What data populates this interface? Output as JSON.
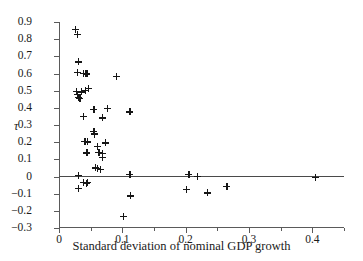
{
  "chart_data": {
    "type": "scatter",
    "title": "",
    "xlabel": "Standard deviation of nominal GDP growth",
    "ylabel": "τ",
    "xlim": [
      0,
      0.45
    ],
    "ylim": [
      -0.3,
      0.9
    ],
    "grid": false,
    "legend": null,
    "marker": "plus",
    "marker_color": "#161616",
    "axis_color": "#5a5a5a",
    "reference_lines": [
      {
        "name": "zero-line",
        "axis": "y",
        "value": 0
      }
    ],
    "xticks": [
      0,
      0.1,
      0.2,
      0.3,
      0.4
    ],
    "xtick_labels": [
      "0",
      "0.1",
      "0.2",
      "0.3",
      "0.4"
    ],
    "xticks_minor": [
      0.05,
      0.15,
      0.25,
      0.35,
      0.45
    ],
    "yticks": [
      0.9,
      0.8,
      0.7,
      0.6,
      0.5,
      0.4,
      0.3,
      0.2,
      0.1,
      0,
      -0.1,
      -0.2,
      -0.3
    ],
    "ytick_labels": [
      "0.9",
      "0.8",
      "0.7",
      "0.6",
      "0.5",
      "0.4",
      "0.3",
      "0.2",
      "0.1",
      "0",
      "−0.1",
      "−0.2",
      "−0.3"
    ],
    "points": [
      {
        "x": 0.026,
        "y": 0.855
      },
      {
        "x": 0.029,
        "y": 0.828
      },
      {
        "x": 0.031,
        "y": 0.668
      },
      {
        "x": 0.029,
        "y": 0.607
      },
      {
        "x": 0.038,
        "y": 0.6
      },
      {
        "x": 0.042,
        "y": 0.601
      },
      {
        "x": 0.044,
        "y": 0.598
      },
      {
        "x": 0.091,
        "y": 0.583
      },
      {
        "x": 0.028,
        "y": 0.494
      },
      {
        "x": 0.036,
        "y": 0.493
      },
      {
        "x": 0.042,
        "y": 0.503
      },
      {
        "x": 0.047,
        "y": 0.513
      },
      {
        "x": 0.029,
        "y": 0.477
      },
      {
        "x": 0.03,
        "y": 0.463
      },
      {
        "x": 0.033,
        "y": 0.455
      },
      {
        "x": 0.055,
        "y": 0.393
      },
      {
        "x": 0.076,
        "y": 0.399
      },
      {
        "x": 0.112,
        "y": 0.376
      },
      {
        "x": 0.039,
        "y": 0.348
      },
      {
        "x": 0.068,
        "y": 0.341
      },
      {
        "x": 0.055,
        "y": 0.262
      },
      {
        "x": 0.056,
        "y": 0.252
      },
      {
        "x": 0.056,
        "y": 0.243
      },
      {
        "x": 0.041,
        "y": 0.204
      },
      {
        "x": 0.045,
        "y": 0.202
      },
      {
        "x": 0.073,
        "y": 0.196
      },
      {
        "x": 0.061,
        "y": 0.177
      },
      {
        "x": 0.044,
        "y": 0.137
      },
      {
        "x": 0.063,
        "y": 0.14
      },
      {
        "x": 0.069,
        "y": 0.133
      },
      {
        "x": 0.069,
        "y": 0.111
      },
      {
        "x": 0.057,
        "y": 0.05
      },
      {
        "x": 0.061,
        "y": 0.049
      },
      {
        "x": 0.065,
        "y": 0.042
      },
      {
        "x": 0.031,
        "y": 0.006
      },
      {
        "x": 0.112,
        "y": 0.011
      },
      {
        "x": 0.205,
        "y": 0.01
      },
      {
        "x": 0.218,
        "y": 0.0
      },
      {
        "x": 0.405,
        "y": -0.003
      },
      {
        "x": 0.039,
        "y": -0.035
      },
      {
        "x": 0.043,
        "y": -0.041
      },
      {
        "x": 0.045,
        "y": -0.036
      },
      {
        "x": 0.031,
        "y": -0.068
      },
      {
        "x": 0.201,
        "y": -0.077
      },
      {
        "x": 0.265,
        "y": -0.057
      },
      {
        "x": 0.234,
        "y": -0.096
      },
      {
        "x": 0.113,
        "y": -0.113
      },
      {
        "x": 0.102,
        "y": -0.233
      }
    ]
  }
}
